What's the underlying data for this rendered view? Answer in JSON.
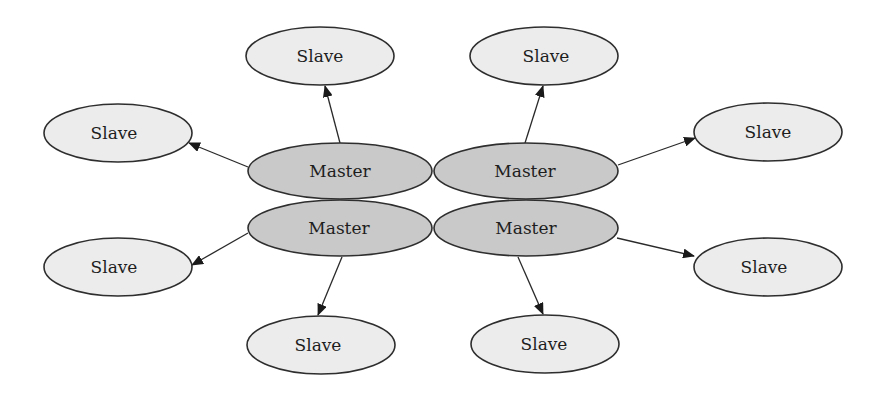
{
  "diagram": {
    "title": "",
    "colors": {
      "master_fill": "#c9c9c9",
      "slave_fill": "#ececec",
      "stroke": "#2e2e2e",
      "background": "#ffffff"
    },
    "masters": [
      {
        "id": "m1",
        "label": "Master",
        "cx": 340,
        "cy": 171
      },
      {
        "id": "m2",
        "label": "Master",
        "cx": 526,
        "cy": 171
      },
      {
        "id": "m3",
        "label": "Master",
        "cx": 340,
        "cy": 228
      },
      {
        "id": "m4",
        "label": "Master",
        "cx": 526,
        "cy": 228
      }
    ],
    "slaves": [
      {
        "id": "s1",
        "label": "Slave",
        "cx": 320,
        "cy": 56
      },
      {
        "id": "s2",
        "label": "Slave",
        "cx": 118,
        "cy": 133
      },
      {
        "id": "s3",
        "label": "Slave",
        "cx": 544,
        "cy": 56
      },
      {
        "id": "s4",
        "label": "Slave",
        "cx": 768,
        "cy": 132
      },
      {
        "id": "s5",
        "label": "Slave",
        "cx": 118,
        "cy": 267
      },
      {
        "id": "s6",
        "label": "Slave",
        "cx": 321,
        "cy": 345
      },
      {
        "id": "s7",
        "label": "Slave",
        "cx": 768,
        "cy": 267
      },
      {
        "id": "s8",
        "label": "Slave",
        "cx": 545,
        "cy": 344
      }
    ],
    "edges": [
      {
        "from": "m1",
        "to": "s1"
      },
      {
        "from": "m1",
        "to": "s2"
      },
      {
        "from": "m2",
        "to": "s3"
      },
      {
        "from": "m2",
        "to": "s4"
      },
      {
        "from": "m3",
        "to": "s5"
      },
      {
        "from": "m3",
        "to": "s6"
      },
      {
        "from": "m4",
        "to": "s7"
      },
      {
        "from": "m4",
        "to": "s8"
      }
    ]
  }
}
